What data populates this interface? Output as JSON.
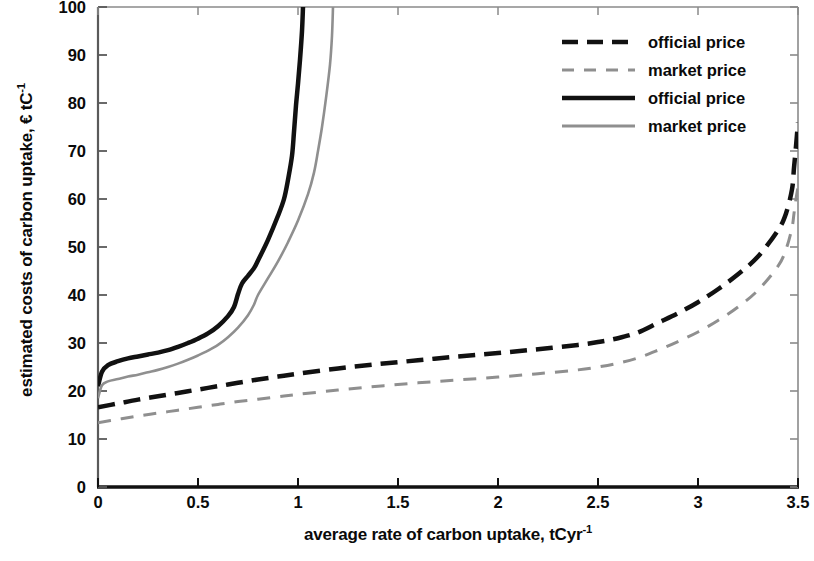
{
  "chart_data": {
    "type": "line",
    "title": "",
    "xlabel": "average rate of carbon uptake, tCyr",
    "xlabel_sup": "-1",
    "ylabel": "estimated costs of carbon uptake, € tC",
    "ylabel_sup": "-1",
    "xlim": [
      0,
      3.5
    ],
    "ylim": [
      0,
      100
    ],
    "xticks": [
      "0",
      "0.5",
      "1",
      "1.5",
      "2",
      "2.5",
      "3",
      "3.5"
    ],
    "xtick_values": [
      0,
      0.5,
      1,
      1.5,
      2,
      2.5,
      3,
      3.5
    ],
    "yticks": [
      "0",
      "10",
      "20",
      "30",
      "40",
      "50",
      "60",
      "70",
      "80",
      "90",
      "100"
    ],
    "ytick_values": [
      0,
      10,
      20,
      30,
      40,
      50,
      60,
      70,
      80,
      90,
      100
    ],
    "grid": false,
    "legend_position": "top-right",
    "series": [
      {
        "name": "official price",
        "style": "dashed",
        "color": "#111111",
        "width": 4.5,
        "points": [
          [
            0.0,
            16.6
          ],
          [
            0.1,
            17.4
          ],
          [
            0.2,
            18.2
          ],
          [
            0.3,
            18.9
          ],
          [
            0.4,
            19.6
          ],
          [
            0.5,
            20.3
          ],
          [
            0.6,
            21.0
          ],
          [
            0.7,
            21.7
          ],
          [
            0.8,
            22.4
          ],
          [
            0.9,
            23.0
          ],
          [
            1.0,
            23.6
          ],
          [
            1.2,
            24.7
          ],
          [
            1.4,
            25.6
          ],
          [
            1.6,
            26.4
          ],
          [
            1.8,
            27.2
          ],
          [
            2.0,
            27.9
          ],
          [
            2.2,
            28.7
          ],
          [
            2.4,
            29.6
          ],
          [
            2.5,
            30.2
          ],
          [
            2.6,
            31.0
          ],
          [
            2.7,
            32.2
          ],
          [
            2.8,
            34.2
          ],
          [
            2.9,
            36.2
          ],
          [
            3.0,
            38.5
          ],
          [
            3.1,
            41.2
          ],
          [
            3.2,
            44.3
          ],
          [
            3.3,
            48.0
          ],
          [
            3.4,
            53.5
          ],
          [
            3.44,
            57.0
          ],
          [
            3.47,
            62.0
          ],
          [
            3.48,
            66.5
          ],
          [
            3.49,
            71.0
          ],
          [
            3.5,
            76.0
          ]
        ]
      },
      {
        "name": "market price",
        "style": "dashed",
        "color": "#8f8f8f",
        "width": 3.0,
        "points": [
          [
            0.0,
            13.4
          ],
          [
            0.1,
            14.1
          ],
          [
            0.2,
            14.8
          ],
          [
            0.3,
            15.4
          ],
          [
            0.4,
            16.0
          ],
          [
            0.5,
            16.6
          ],
          [
            0.6,
            17.2
          ],
          [
            0.7,
            17.8
          ],
          [
            0.8,
            18.3
          ],
          [
            0.9,
            18.8
          ],
          [
            1.0,
            19.3
          ],
          [
            1.2,
            20.2
          ],
          [
            1.4,
            21.0
          ],
          [
            1.6,
            21.7
          ],
          [
            1.8,
            22.3
          ],
          [
            2.0,
            22.9
          ],
          [
            2.2,
            23.6
          ],
          [
            2.4,
            24.4
          ],
          [
            2.5,
            25.0
          ],
          [
            2.6,
            25.8
          ],
          [
            2.7,
            26.9
          ],
          [
            2.8,
            28.5
          ],
          [
            2.9,
            30.3
          ],
          [
            3.0,
            32.3
          ],
          [
            3.1,
            34.7
          ],
          [
            3.2,
            37.5
          ],
          [
            3.3,
            41.0
          ],
          [
            3.4,
            46.0
          ],
          [
            3.44,
            49.5
          ],
          [
            3.47,
            54.0
          ],
          [
            3.48,
            57.0
          ],
          [
            3.49,
            60.0
          ],
          [
            3.5,
            62.5
          ]
        ]
      },
      {
        "name": "official price",
        "style": "solid",
        "color": "#111111",
        "width": 4.5,
        "points": [
          [
            0.0,
            21.0
          ],
          [
            0.02,
            24.0
          ],
          [
            0.05,
            25.4
          ],
          [
            0.1,
            26.2
          ],
          [
            0.15,
            26.8
          ],
          [
            0.2,
            27.2
          ],
          [
            0.25,
            27.6
          ],
          [
            0.3,
            28.0
          ],
          [
            0.35,
            28.5
          ],
          [
            0.4,
            29.2
          ],
          [
            0.45,
            30.0
          ],
          [
            0.5,
            30.9
          ],
          [
            0.55,
            32.0
          ],
          [
            0.6,
            33.5
          ],
          [
            0.65,
            35.6
          ],
          [
            0.68,
            37.5
          ],
          [
            0.7,
            40.2
          ],
          [
            0.72,
            42.4
          ],
          [
            0.75,
            44.0
          ],
          [
            0.78,
            45.6
          ],
          [
            0.8,
            47.2
          ],
          [
            0.85,
            51.5
          ],
          [
            0.9,
            56.5
          ],
          [
            0.93,
            60.0
          ],
          [
            0.95,
            64.0
          ],
          [
            0.97,
            69.0
          ],
          [
            0.98,
            74.0
          ],
          [
            0.99,
            79.5
          ],
          [
            1.0,
            84.0
          ],
          [
            1.01,
            89.0
          ],
          [
            1.02,
            95.0
          ],
          [
            1.025,
            100.0
          ]
        ]
      },
      {
        "name": "market price",
        "style": "solid",
        "color": "#8f8f8f",
        "width": 2.6,
        "points": [
          [
            0.0,
            18.5
          ],
          [
            0.02,
            21.2
          ],
          [
            0.05,
            22.0
          ],
          [
            0.1,
            22.5
          ],
          [
            0.15,
            23.0
          ],
          [
            0.2,
            23.4
          ],
          [
            0.25,
            23.9
          ],
          [
            0.3,
            24.4
          ],
          [
            0.35,
            25.0
          ],
          [
            0.4,
            25.7
          ],
          [
            0.45,
            26.5
          ],
          [
            0.5,
            27.4
          ],
          [
            0.55,
            28.4
          ],
          [
            0.6,
            29.6
          ],
          [
            0.65,
            31.2
          ],
          [
            0.7,
            33.2
          ],
          [
            0.75,
            35.8
          ],
          [
            0.78,
            38.0
          ],
          [
            0.8,
            40.0
          ],
          [
            0.85,
            43.5
          ],
          [
            0.9,
            47.0
          ],
          [
            0.95,
            51.0
          ],
          [
            1.0,
            55.5
          ],
          [
            1.05,
            61.0
          ],
          [
            1.08,
            65.5
          ],
          [
            1.1,
            70.0
          ],
          [
            1.12,
            75.0
          ],
          [
            1.14,
            81.0
          ],
          [
            1.16,
            88.0
          ],
          [
            1.17,
            94.0
          ],
          [
            1.175,
            100.0
          ]
        ]
      }
    ],
    "legend": [
      {
        "label": "official price",
        "style": "dashed",
        "color": "#111111",
        "width": 4.5
      },
      {
        "label": "market price",
        "style": "dashed",
        "color": "#8f8f8f",
        "width": 3.2
      },
      {
        "label": "official price",
        "style": "solid",
        "color": "#111111",
        "width": 4.5
      },
      {
        "label": "market price",
        "style": "solid",
        "color": "#8f8f8f",
        "width": 3.2
      }
    ]
  }
}
